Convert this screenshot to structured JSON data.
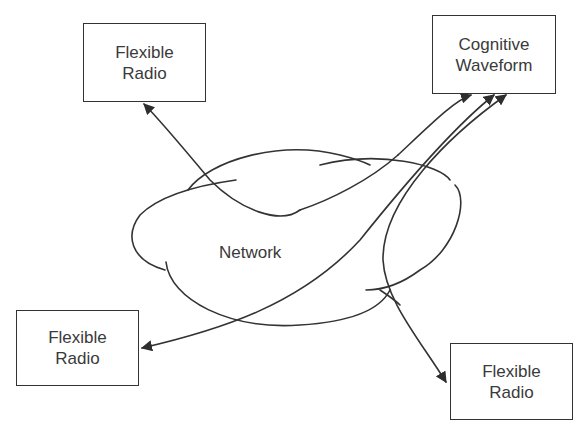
{
  "diagram": {
    "nodes": [
      {
        "id": "radio_top_left",
        "line1": "Flexible",
        "line2": "Radio"
      },
      {
        "id": "cognitive_waveform",
        "line1": "Cognitive",
        "line2": "Waveform"
      },
      {
        "id": "radio_bottom_left",
        "line1": "Flexible",
        "line2": "Radio"
      },
      {
        "id": "radio_bottom_right",
        "line1": "Flexible",
        "line2": "Radio"
      }
    ],
    "cloud": {
      "label": "Network"
    },
    "edges": [
      {
        "from": "network",
        "to": "radio_top_left"
      },
      {
        "from": "network",
        "to": "cognitive_waveform"
      },
      {
        "from": "radio_bottom_left",
        "to": "cognitive_waveform",
        "bidirectional": true
      },
      {
        "from": "radio_bottom_right",
        "to": "cognitive_waveform",
        "bidirectional": true
      }
    ],
    "colors": {
      "stroke": "#333333",
      "text": "#3a3a3a",
      "background": "#ffffff"
    }
  }
}
